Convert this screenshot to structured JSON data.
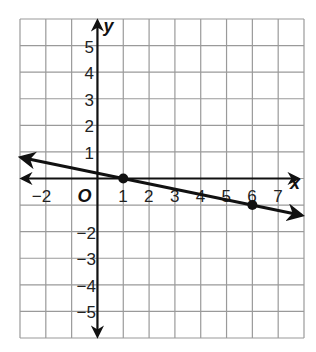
{
  "chart_data": {
    "type": "line",
    "title": "",
    "xlabel": "x",
    "ylabel": "y",
    "origin_label": "O",
    "xlim": [
      -3,
      8
    ],
    "ylim": [
      -6,
      6
    ],
    "grid": true,
    "x_ticks": [
      "-2",
      "1",
      "2",
      "3",
      "4",
      "5",
      "6",
      "7"
    ],
    "y_ticks": [
      "5",
      "4",
      "3",
      "2",
      "1",
      "-2",
      "-3",
      "-4",
      "-5"
    ],
    "series": [
      {
        "name": "line",
        "points": [
          {
            "x": 1,
            "y": 0
          },
          {
            "x": 6,
            "y": -1
          }
        ],
        "slope": -0.2,
        "intercept": 0.2,
        "arrows_both_ends": true
      }
    ]
  }
}
